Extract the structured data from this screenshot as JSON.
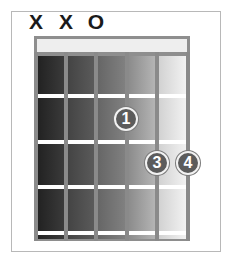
{
  "diagram": {
    "type": "guitar-chord-chart",
    "string_markers": [
      {
        "string": 6,
        "label": "X",
        "x": 36
      },
      {
        "string": 5,
        "label": "X",
        "x": 66
      },
      {
        "string": 4,
        "label": "O",
        "x": 96
      }
    ],
    "fingers": [
      {
        "label": "1",
        "string": 3,
        "fret": 2,
        "x": 126,
        "y": 119
      },
      {
        "label": "3",
        "string": 2,
        "fret": 3,
        "x": 157,
        "y": 163
      },
      {
        "label": "4",
        "string": 1,
        "fret": 3,
        "x": 188,
        "y": 163
      }
    ],
    "column_colors": [
      "#2e2e2e",
      "#4a4a4a",
      "#6c6c6c",
      "#9a9a9a",
      "#e4e4e4"
    ],
    "frets_shown": 4
  }
}
